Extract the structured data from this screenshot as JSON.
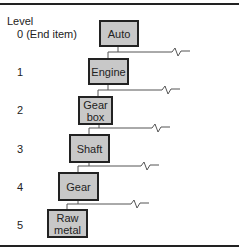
{
  "diagram": {
    "header": "Level",
    "levels": [
      {
        "label": "0 (End item)",
        "item": "Auto"
      },
      {
        "label": "1",
        "item": "Engine"
      },
      {
        "label": "2",
        "item": "Gear\nbox"
      },
      {
        "label": "3",
        "item": "Shaft"
      },
      {
        "label": "4",
        "item": "Gear"
      },
      {
        "label": "5",
        "item": "Raw\nmetal"
      }
    ],
    "colors": {
      "box_fill": "#c8c8c8",
      "border": "#222222",
      "line": "#555555"
    }
  }
}
